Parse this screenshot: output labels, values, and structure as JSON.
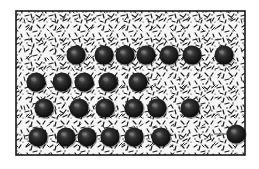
{
  "diagram": {
    "type": "particle-lattice-illustration",
    "frame": {
      "x": 16,
      "y": 11,
      "width": 229,
      "height": 144,
      "stroke": "#1a1a1a",
      "background": "#f4f4f4",
      "texture_color": "#2a2a2a"
    },
    "sphere": {
      "radius": 9.5,
      "fill_dark": "#0e0e0e",
      "fill_mid": "#3c3c3c",
      "highlight": "#8a8a8a"
    },
    "rows": [
      {
        "y": 55,
        "x": [
          76,
          104,
          125,
          146,
          169,
          192,
          224
        ]
      },
      {
        "y": 82,
        "x": [
          36,
          62,
          84,
          108,
          138
        ]
      },
      {
        "y": 108,
        "x": [
          44,
          79,
          105,
          134,
          157,
          190
        ]
      },
      {
        "y": 137,
        "x": [
          38,
          66,
          87,
          110,
          134,
          161
        ]
      }
    ],
    "moving_particle": {
      "x": 236,
      "y": 134,
      "trail_from_x": 214,
      "trail_to_x": 230
    },
    "arrows": [
      {
        "from_x": 117,
        "to_x": 133,
        "y": 55,
        "direction": "right"
      },
      {
        "from_x": 156,
        "to_x": 139,
        "y": 55,
        "direction": "left"
      }
    ]
  }
}
